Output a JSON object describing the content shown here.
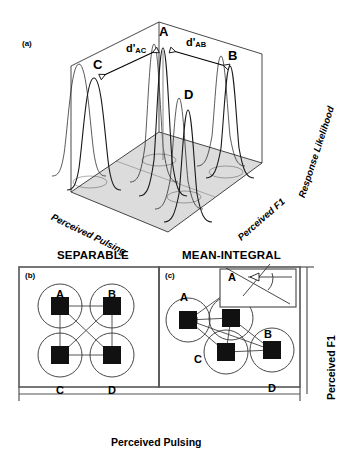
{
  "figure": {
    "panel_a": {
      "label": "(a)",
      "axis_z": "Response Likelihood",
      "axis_y": "Perceived F1",
      "axis_x": "Perceived Pulsing",
      "peaks": [
        {
          "id": "A",
          "label": "A"
        },
        {
          "id": "B",
          "label": "B"
        },
        {
          "id": "C",
          "label": "C"
        },
        {
          "id": "D",
          "label": "D"
        }
      ],
      "distances": [
        {
          "id": "d_ac",
          "prefix": "d'",
          "subscript": "AC"
        },
        {
          "id": "d_ab",
          "prefix": "d'",
          "subscript": "AB"
        }
      ]
    },
    "panel_b": {
      "label": "(b)",
      "header": "SEPARABLE",
      "nodes": [
        {
          "id": "A",
          "label": "A"
        },
        {
          "id": "B",
          "label": "B"
        },
        {
          "id": "C",
          "label": "C"
        },
        {
          "id": "D",
          "label": "D"
        }
      ]
    },
    "panel_c": {
      "label": "(c)",
      "header": "MEAN-INTEGRAL",
      "nodes": [
        {
          "id": "A",
          "label": "A"
        },
        {
          "id": "B",
          "label": "B"
        },
        {
          "id": "C",
          "label": "C"
        },
        {
          "id": "D",
          "label": "D"
        }
      ],
      "inset": {
        "label": "A"
      }
    },
    "axes": {
      "y_label": "Perceived F1",
      "x_label": "Perceived Pulsing"
    },
    "colors": {
      "ink": "#000000",
      "base_plane": "#d8d8d8",
      "frame": "#555555",
      "curve": "#1a1a1a"
    }
  }
}
